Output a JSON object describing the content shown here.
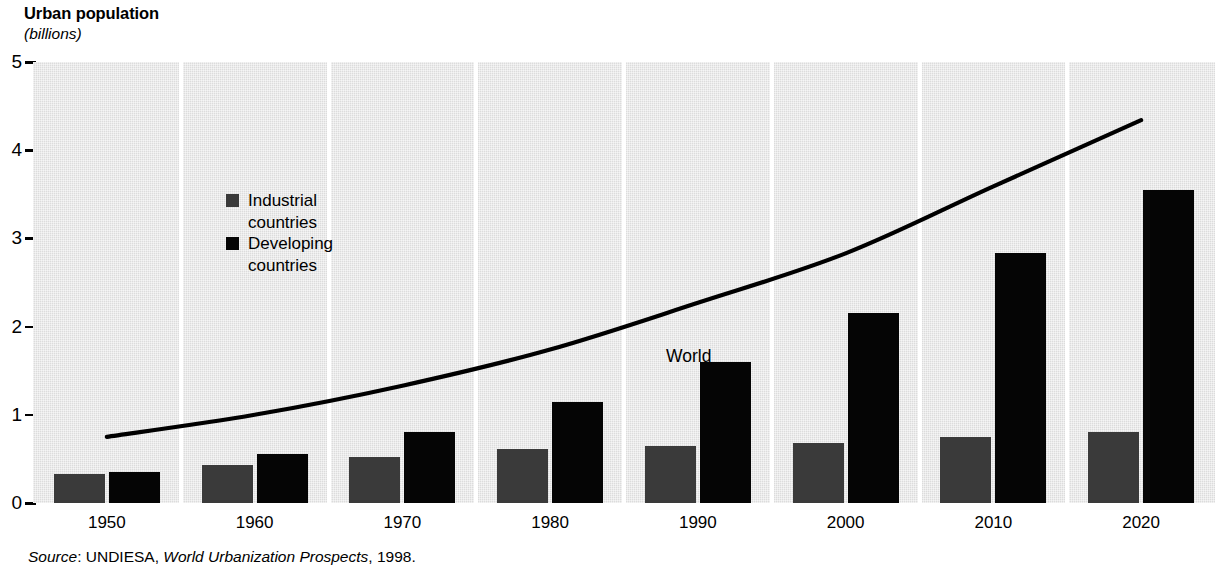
{
  "title": "Urban population",
  "subtitle": "(billions)",
  "source": {
    "label": "Source",
    "separator": ": ",
    "publisher": "UNDIESA, ",
    "work": "World Urbanization Prospects",
    "year": ", 1998."
  },
  "legend": {
    "items": [
      {
        "label": "Industrial\ncountries",
        "color": "#3a3a3a",
        "swatch": "industrial-swatch"
      },
      {
        "label": "Developing\ncountries",
        "color": "#050505",
        "swatch": "developing-swatch"
      }
    ]
  },
  "annotations": {
    "world_label": "World"
  },
  "colors": {
    "plot_background": "#dcdcdc",
    "separator": "#ffffff",
    "industrial": "#3a3a3a",
    "developing": "#050505",
    "line": "#000000"
  },
  "chart_data": {
    "type": "bar",
    "title": "Urban population",
    "subtitle": "(billions)",
    "xlabel": "",
    "ylabel": "billions",
    "ylim": [
      0,
      5
    ],
    "yticks": [
      "0",
      "1",
      "2",
      "3",
      "4",
      "5"
    ],
    "ytick_values": [
      0,
      1,
      2,
      3,
      4,
      5
    ],
    "grid": false,
    "legend_position": "inside-upper-left",
    "categories": [
      "1950",
      "1960",
      "1970",
      "1980",
      "1990",
      "2000",
      "2010",
      "2020"
    ],
    "series": [
      {
        "name": "Industrial countries",
        "color": "#3a3a3a",
        "values": [
          0.33,
          0.43,
          0.52,
          0.61,
          0.65,
          0.68,
          0.75,
          0.8
        ]
      },
      {
        "name": "Developing countries",
        "color": "#050505",
        "values": [
          0.35,
          0.55,
          0.8,
          1.14,
          1.6,
          2.15,
          2.84,
          3.55
        ]
      }
    ],
    "overlay_line": {
      "name": "World",
      "type": "line",
      "color": "#000000",
      "x": [
        "1950",
        "1960",
        "1970",
        "1980",
        "1990",
        "2000",
        "2010",
        "2020"
      ],
      "values": [
        0.75,
        1.0,
        1.33,
        1.74,
        2.27,
        2.83,
        3.59,
        4.34
      ]
    }
  }
}
